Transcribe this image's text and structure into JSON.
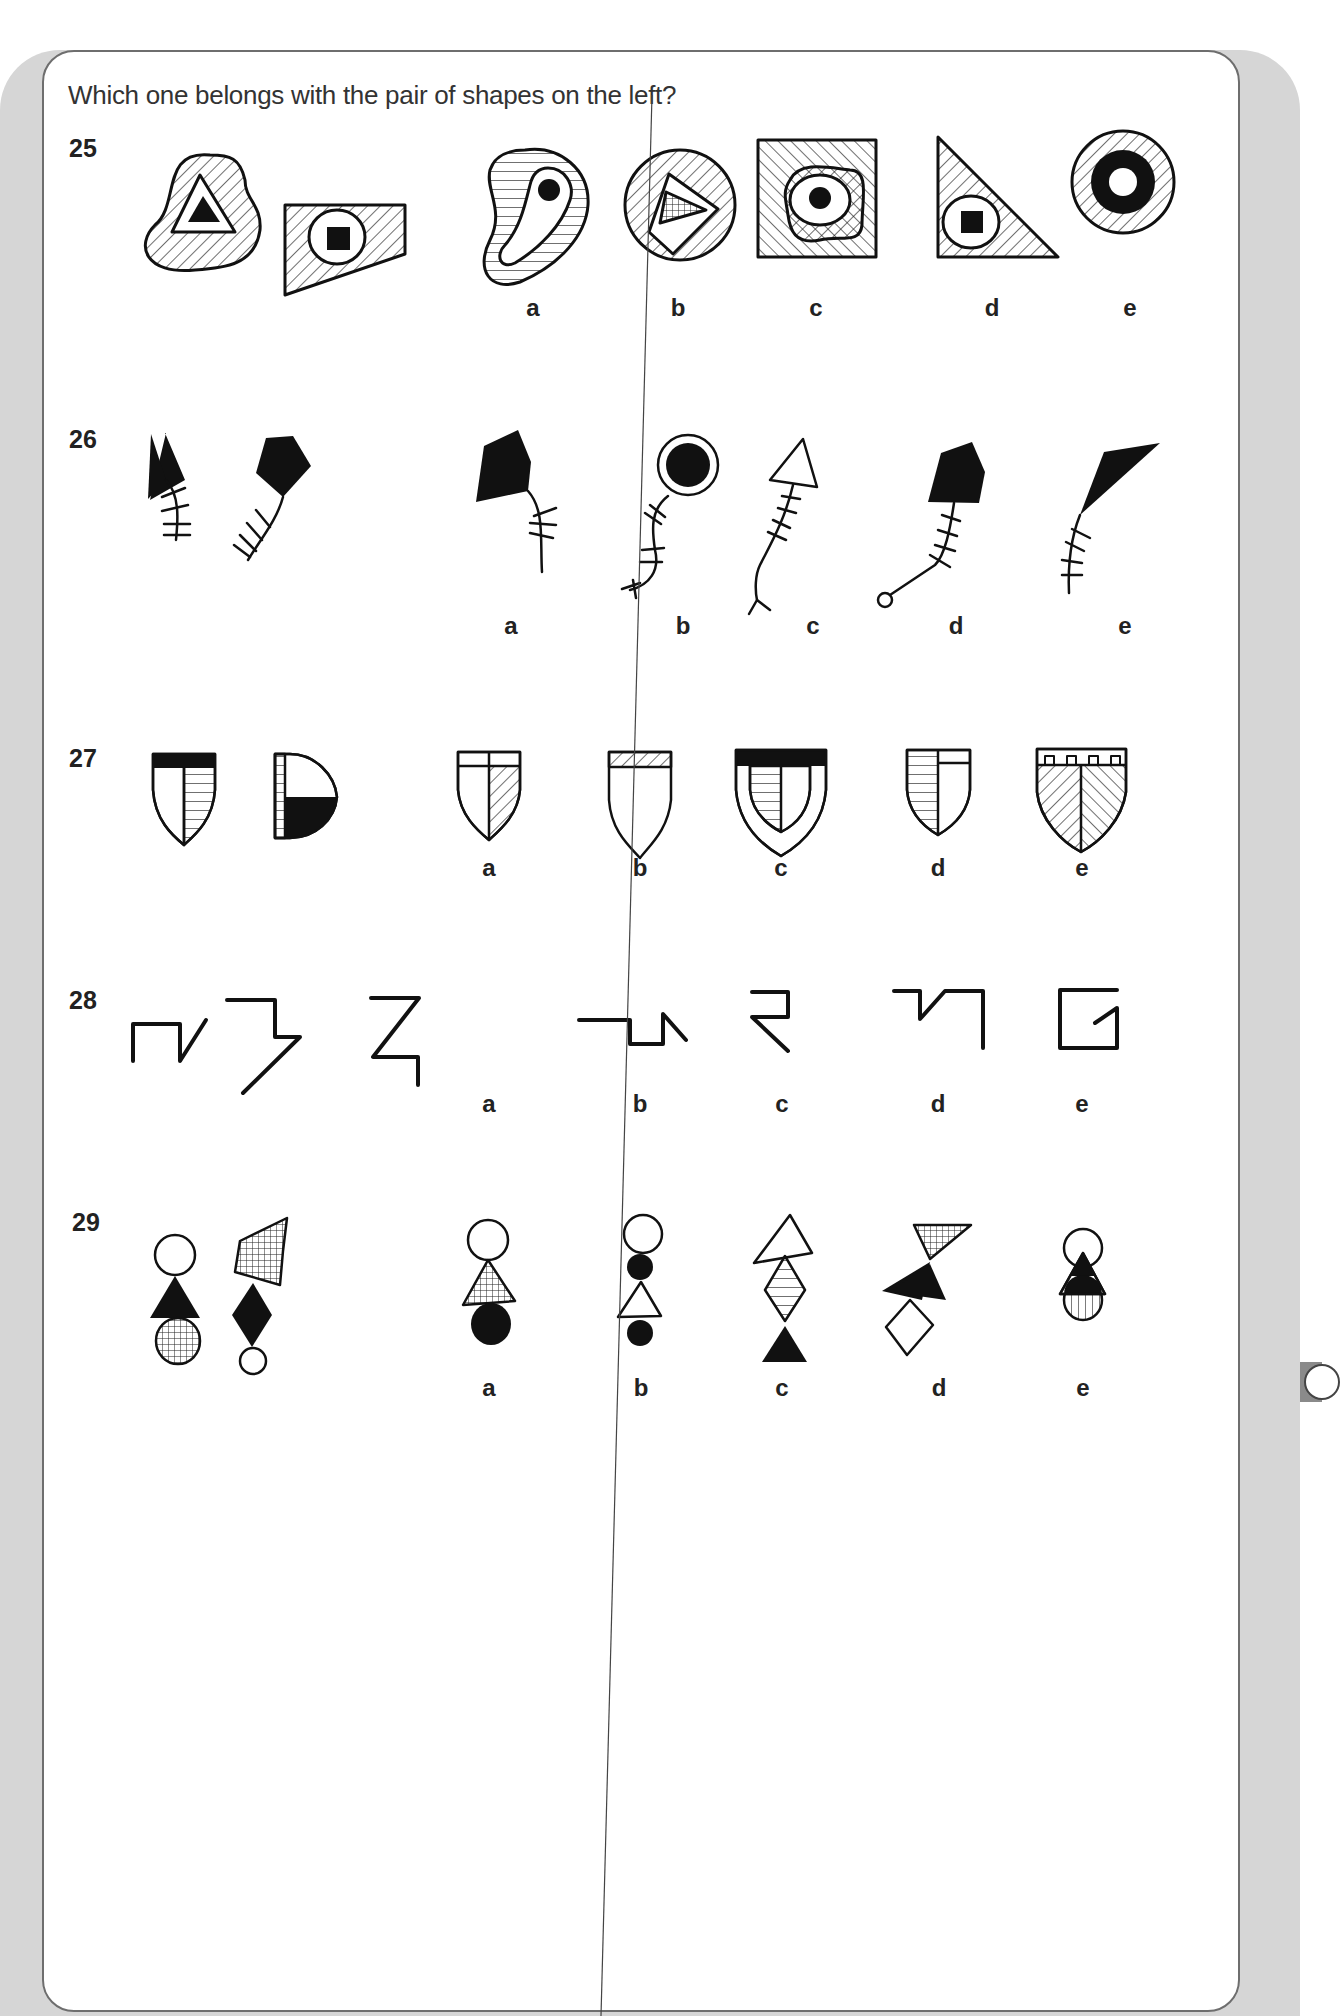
{
  "page": {
    "instruction": "Which one belongs with the pair of shapes on the left?",
    "colors": {
      "ink": "#111111",
      "card_border": "#6e6e6e",
      "panel": "#d6d6d6",
      "background": "#ffffff"
    }
  },
  "questions": [
    {
      "number": "25",
      "pair": [
        "hatched rounded blob containing white triangle with black triangle",
        "hatched trapezoid containing white circle with black square"
      ],
      "options": [
        {
          "label": "a",
          "desc": "horizontally striped kidney shape containing white shape with black dot"
        },
        {
          "label": "b",
          "desc": "hatched circle containing white rectangle with cross-hatched triangle"
        },
        {
          "label": "c",
          "desc": "hatched square containing hatched blob, white oval, black dot"
        },
        {
          "label": "d",
          "desc": "hatched right triangle containing white oval with black square"
        },
        {
          "label": "e",
          "desc": "hatched circle containing black ring with white centre"
        }
      ]
    },
    {
      "number": "26",
      "pair": [
        "black triangle with fishbone tail",
        "black pentagon with fishbone tail"
      ],
      "options": [
        {
          "label": "a",
          "desc": "black pentagon with fishbone tail"
        },
        {
          "label": "b",
          "desc": "black circle in ring with wavy fishbone tail"
        },
        {
          "label": "c",
          "desc": "white triangle with fishbone tail and forked end"
        },
        {
          "label": "d",
          "desc": "black pentagon with fishbone tail ending in small circle"
        },
        {
          "label": "e",
          "desc": "black quadrilateral with fishbone tail"
        }
      ]
    },
    {
      "number": "27",
      "pair": [
        "shield with black top band, split with striped half",
        "D-shape with striped band and black quadrant"
      ],
      "options": [
        {
          "label": "a",
          "desc": "shield with white band, hatched right half"
        },
        {
          "label": "b",
          "desc": "shield with hatched top band"
        },
        {
          "label": "c",
          "desc": "shield with black band and inner striped half-shield"
        },
        {
          "label": "d",
          "desc": "shield with striped left half and white band on right"
        },
        {
          "label": "e",
          "desc": "shield with crenellated band and chevron hatching"
        }
      ]
    },
    {
      "number": "28",
      "pair": [
        "line figure with square step and diagonal",
        "line figure step with long diagonal"
      ],
      "options": [
        {
          "label": "a",
          "desc": "Z-shaped line with vertical tail"
        },
        {
          "label": "b",
          "desc": "horizontal line with square dip and diagonal"
        },
        {
          "label": "c",
          "desc": "reversed-Z line with long diagonal"
        },
        {
          "label": "d",
          "desc": "horizontal step, diagonal and vertical line"
        },
        {
          "label": "e",
          "desc": "open square with internal diagonal"
        }
      ]
    },
    {
      "number": "29",
      "pair": [
        "white circle, black triangle, gridded circle stacked",
        "gridded pentagon, black diamond, white circle stacked"
      ],
      "options": [
        {
          "label": "a",
          "desc": "white circle, gridded triangle, black circle"
        },
        {
          "label": "b",
          "desc": "white circle, black dot, white triangle, black dot"
        },
        {
          "label": "c",
          "desc": "white triangle, striped diamond, black triangle"
        },
        {
          "label": "d",
          "desc": "gridded triangle, black triangle, white diamond"
        },
        {
          "label": "e",
          "desc": "overlapping circle, triangle and striped circle"
        }
      ]
    }
  ]
}
